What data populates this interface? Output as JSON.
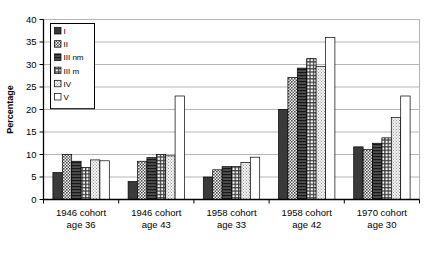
{
  "chart_data": {
    "type": "bar",
    "title": "",
    "subtitle": "",
    "xlabel": "",
    "ylabel": "Percentage",
    "ylim": [
      0,
      40
    ],
    "ytick_step": 5,
    "yticks": [
      "0",
      "5",
      "10",
      "15",
      "20",
      "25",
      "30",
      "35",
      "40"
    ],
    "grid": true,
    "grid_axis": "y",
    "legend_position": "upper-left-inside",
    "categories": [
      "1946 cohort age 36",
      "1946 cohort age 43",
      "1958 cohort age 33",
      "1958 cohort age 42",
      "1970 cohort age 30"
    ],
    "category_lines": [
      [
        "1946 cohort",
        "age 36"
      ],
      [
        "1946 cohort",
        "age 43"
      ],
      [
        "1958 cohort",
        "age 33"
      ],
      [
        "1958 cohort",
        "age 42"
      ],
      [
        "1970 cohort",
        "age 30"
      ]
    ],
    "series": [
      {
        "name": "I",
        "fill": "solid-dark",
        "color": "#3a3a3a",
        "values": [
          6.0,
          4.0,
          5.0,
          20.0,
          11.7
        ]
      },
      {
        "name": "II",
        "fill": "checker-medium",
        "color": "#8a8a8a",
        "values": [
          10.0,
          8.5,
          6.6,
          27.1,
          11.1
        ]
      },
      {
        "name": "III nm",
        "fill": "horizontal-lines-dark",
        "color": "#555555",
        "values": [
          8.5,
          9.3,
          7.3,
          29.2,
          12.5
        ]
      },
      {
        "name": "III m",
        "fill": "grid-crosshatch",
        "color": "#6e6e6e",
        "values": [
          7.1,
          10.0,
          7.3,
          31.3,
          13.7
        ]
      },
      {
        "name": "IV",
        "fill": "dots-light",
        "color": "#d8d8d8",
        "values": [
          8.8,
          9.7,
          8.2,
          29.6,
          18.2
        ]
      },
      {
        "name": "V",
        "fill": "white",
        "color": "#ffffff",
        "values": [
          8.6,
          23.0,
          9.4,
          36.0,
          23.0
        ]
      }
    ]
  },
  "legend": {
    "items": [
      {
        "label": "I"
      },
      {
        "label": "II"
      },
      {
        "label": "III nm"
      },
      {
        "label": "III m"
      },
      {
        "label": "IV"
      },
      {
        "label": "V"
      }
    ]
  },
  "axis": {
    "y_title": "Percentage"
  },
  "colors": {
    "axis": "#000000",
    "grid": "#b5b5b5",
    "bar_outline": "#000000",
    "background": "#ffffff"
  }
}
